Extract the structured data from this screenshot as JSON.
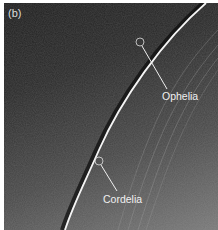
{
  "figure": {
    "panel_label": "(b)",
    "moons": [
      {
        "name": "Ophelia"
      },
      {
        "name": "Cordelia"
      }
    ]
  }
}
